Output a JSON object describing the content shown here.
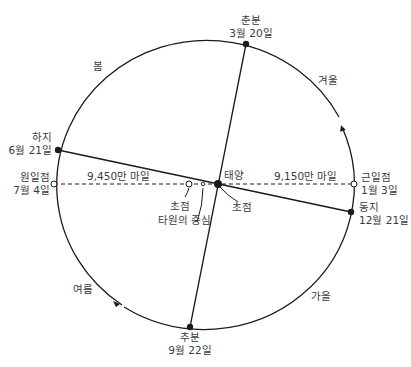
{
  "diagram": {
    "type": "earth-orbit-ellipse",
    "colors": {
      "line": "#1a1a1a",
      "text": "#3a3a3a",
      "background": "#ffffff"
    },
    "points": {
      "vernal_equinox": {
        "name": "춘분",
        "date": "3월 20일"
      },
      "autumnal_equinox": {
        "name": "추분",
        "date": "9월 22일"
      },
      "summer_solstice": {
        "name": "하지",
        "date": "6월 21일"
      },
      "winter_solstice": {
        "name": "동지",
        "date": "12월 21일"
      },
      "aphelion": {
        "name": "원일점",
        "date": "7월 4일"
      },
      "perihelion": {
        "name": "근일점",
        "date": "1월 3일"
      }
    },
    "center_labels": {
      "sun": "태양",
      "focus_sun": "초점",
      "focus_empty": "초점",
      "ellipse_center": "타원의 중심"
    },
    "distances": {
      "aphelion_distance": "9,450만 마일",
      "perihelion_distance": "9,150만 마일"
    },
    "seasons": {
      "spring": "봄",
      "summer": "여름",
      "autumn": "가을",
      "winter": "겨울"
    }
  }
}
